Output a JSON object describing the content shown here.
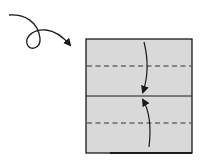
{
  "diagram": {
    "type": "origami-fold-instruction",
    "colors": {
      "paper": "#d9d9d9",
      "outline": "#1a1a1a",
      "background": "#ffffff"
    },
    "paper": {
      "shape": "square",
      "x": 86,
      "y": 39,
      "width": 106,
      "height": 114
    },
    "lines": [
      {
        "kind": "crease-solid",
        "y": 96
      },
      {
        "kind": "valley-fold-dashed",
        "y": 66
      },
      {
        "kind": "valley-fold-dashed",
        "y": 123
      }
    ],
    "arrows": [
      {
        "name": "turn-over-arrow",
        "meaning": "turn paper over"
      },
      {
        "name": "fold-down-arrow",
        "meaning": "fold top edge to center"
      },
      {
        "name": "fold-up-arrow",
        "meaning": "fold bottom edge to center"
      }
    ]
  }
}
